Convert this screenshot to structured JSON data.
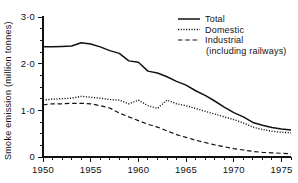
{
  "chart_data": {
    "type": "line",
    "title": "",
    "xlabel": "",
    "ylabel": "Smoke emission (million tonnes)",
    "xlim": [
      1950,
      1976
    ],
    "ylim": [
      0,
      3.0
    ],
    "grid": false,
    "legend_position": "top-right",
    "y_ticks_major": [
      "0",
      "1·0",
      "2·0",
      "3·0"
    ],
    "y_tick_values": [
      0,
      1.0,
      2.0,
      3.0
    ],
    "y_minor_step": 0.25,
    "x_ticks_major": [
      "1950",
      "1955",
      "1960",
      "1965",
      "1970",
      "1975"
    ],
    "x_tick_values": [
      1950,
      1955,
      1960,
      1965,
      1970,
      1975
    ],
    "x_minor_step": 1,
    "x": [
      1950,
      1951,
      1952,
      1953,
      1954,
      1955,
      1956,
      1957,
      1958,
      1959,
      1960,
      1961,
      1962,
      1963,
      1964,
      1965,
      1966,
      1967,
      1968,
      1969,
      1970,
      1971,
      1972,
      1973,
      1974,
      1975,
      1976
    ],
    "series": [
      {
        "name": "Total",
        "style": "solid",
        "color": "#111111",
        "values": [
          2.36,
          2.36,
          2.37,
          2.38,
          2.45,
          2.42,
          2.36,
          2.28,
          2.22,
          2.06,
          2.03,
          1.84,
          1.8,
          1.72,
          1.62,
          1.54,
          1.42,
          1.32,
          1.2,
          1.07,
          0.95,
          0.86,
          0.74,
          0.68,
          0.63,
          0.6,
          0.58
        ]
      },
      {
        "name": "Domestic",
        "style": "dotted",
        "color": "#111111",
        "values": [
          1.22,
          1.24,
          1.25,
          1.26,
          1.3,
          1.28,
          1.26,
          1.23,
          1.22,
          1.14,
          1.22,
          1.1,
          1.04,
          1.22,
          1.14,
          1.1,
          1.04,
          0.98,
          0.92,
          0.86,
          0.8,
          0.73,
          0.64,
          0.59,
          0.55,
          0.53,
          0.52
        ]
      },
      {
        "name": "Industrial (including railways)",
        "style": "dashed",
        "color": "#111111",
        "values": [
          1.12,
          1.14,
          1.14,
          1.15,
          1.15,
          1.14,
          1.1,
          1.05,
          0.94,
          0.86,
          0.78,
          0.7,
          0.64,
          0.56,
          0.48,
          0.42,
          0.36,
          0.31,
          0.26,
          0.22,
          0.18,
          0.15,
          0.12,
          0.1,
          0.09,
          0.08,
          0.07
        ]
      }
    ]
  },
  "legend": {
    "items": [
      {
        "label": "Total",
        "style": "solid"
      },
      {
        "label": "Domestic",
        "style": "dotted"
      },
      {
        "label": "Industrial",
        "style": "dashed"
      },
      {
        "label": "(including railways)",
        "style": "none"
      }
    ]
  },
  "axes": {
    "y_title": "Smoke emission (million tonnes)"
  }
}
